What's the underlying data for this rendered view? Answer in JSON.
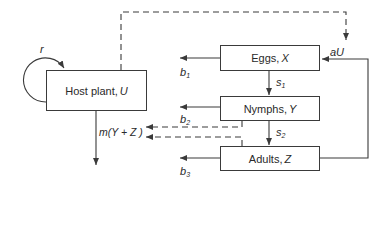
{
  "diagram": {
    "type": "flow",
    "nodes": {
      "host": {
        "label": "Host plant, ",
        "var": "U"
      },
      "eggs": {
        "label": "Eggs, ",
        "var": "X"
      },
      "nymphs": {
        "label": "Nymphs, ",
        "var": "Y"
      },
      "adults": {
        "label": "Adults, ",
        "var": "Z"
      }
    },
    "edges": {
      "r": "r",
      "aU": "aU",
      "b1": {
        "base": "b",
        "sub": "1"
      },
      "b2": {
        "base": "b",
        "sub": "2"
      },
      "b3": {
        "base": "b",
        "sub": "3"
      },
      "s1": {
        "base": "s",
        "sub": "1"
      },
      "s2": {
        "base": "s",
        "sub": "2"
      },
      "m": "m(Y + Z )"
    },
    "colors": {
      "line": "#3a3a3a",
      "text": "#2a2a2a",
      "background": "#ffffff"
    }
  }
}
